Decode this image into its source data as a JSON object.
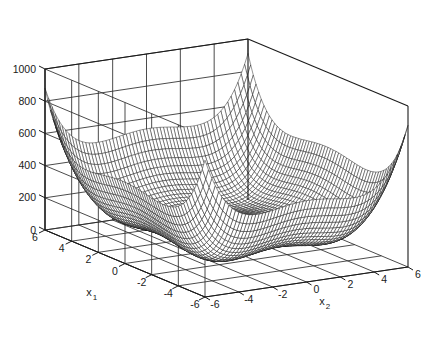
{
  "figure": {
    "title": "",
    "background_color": "#ffffff",
    "axis_color": "#1a1a1a",
    "grid_color": "#2b2b2b",
    "mesh_color": "#111111",
    "mesh_face_color": "#ffffff"
  },
  "axes": {
    "x1": {
      "label": "x",
      "subscript": "1",
      "ticks": [
        6,
        4,
        2,
        0,
        -2,
        -4,
        -6
      ],
      "tick_labels": [
        "6",
        "4",
        "2",
        "0",
        "-2",
        "-4",
        "-6"
      ],
      "range": [
        -6,
        6
      ],
      "direction": "decreasing-left-to-right"
    },
    "x2": {
      "label": "x",
      "subscript": "2",
      "ticks": [
        -6,
        -4,
        -2,
        0,
        2,
        4,
        6
      ],
      "tick_labels": [
        "-6",
        "-4",
        "-2",
        "0",
        "2",
        "4",
        "6"
      ],
      "range": [
        -6,
        6
      ],
      "direction": "increasing-left-to-right"
    },
    "z": {
      "label": "",
      "ticks": [
        0,
        200,
        400,
        600,
        800,
        1000
      ],
      "tick_labels": [
        "0",
        "200",
        "400",
        "600",
        "800",
        "1000"
      ],
      "range": [
        0,
        1000
      ]
    }
  },
  "chart_data": {
    "type": "surface",
    "title": "",
    "xlabel": "x1",
    "ylabel": "x2",
    "zlabel": "",
    "xlim": [
      -6,
      6
    ],
    "ylim": [
      -6,
      6
    ],
    "zlim": [
      0,
      1000
    ],
    "grid": true,
    "legend": false,
    "mesh_style": "wireframe",
    "mesh_resolution": [
      61,
      61
    ],
    "surface_function": "styblinski_tang_shifted",
    "formula": "z = 0.5*((x1^4 - 16*x1^2 + 5*x1) + (x2^4 - 16*x2^2 + 5*x2)) + 160",
    "features": [
      {
        "name": "central-peak",
        "x1": 0.0,
        "x2": 0.0,
        "z": 1000
      },
      {
        "name": "corner-spike-left",
        "x1": 6.0,
        "x2": -6.0,
        "z": 700
      },
      {
        "name": "corner-spike-right",
        "x1": -6.0,
        "x2": 6.0,
        "z": 700
      },
      {
        "name": "global-minimum-front",
        "x1": -2.9,
        "x2": -2.9,
        "z": 0
      },
      {
        "name": "local-minimum",
        "x1": -2.9,
        "x2": 2.75,
        "z": 85
      },
      {
        "name": "local-minimum",
        "x1": 2.75,
        "x2": -2.9,
        "z": 85
      },
      {
        "name": "local-minimum",
        "x1": 2.75,
        "x2": 2.75,
        "z": 165
      }
    ],
    "view": {
      "azimuth": -37.5,
      "elevation": 30
    }
  },
  "tick_label_positions": {
    "z_labels": [
      "1000",
      "800",
      "600",
      "400",
      "200",
      "0"
    ],
    "x1_labels": [
      "6",
      "4",
      "2",
      "0",
      "-2",
      "-4",
      "-6"
    ],
    "x2_labels": [
      "-6",
      "-4",
      "-2",
      "0",
      "2",
      "4",
      "6"
    ]
  }
}
